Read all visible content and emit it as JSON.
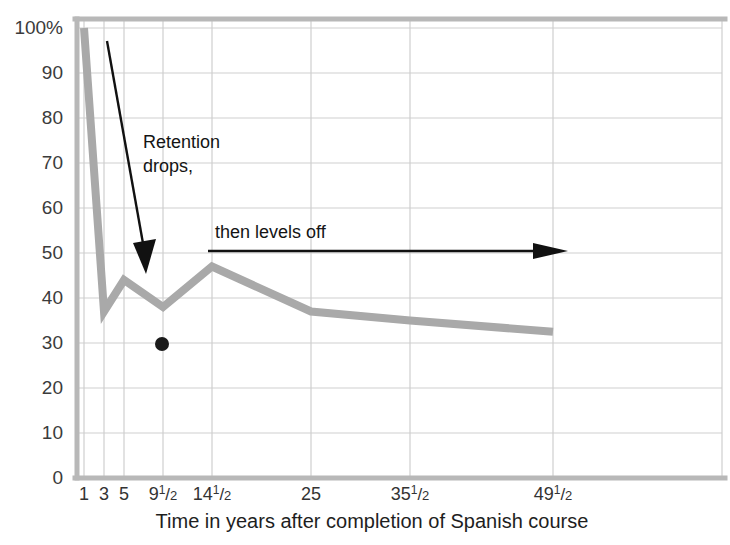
{
  "chart_data": {
    "type": "line",
    "title": "",
    "xlabel": "Time in years after completion of Spanish course",
    "ylabel": "",
    "x_tick_labels": [
      "1",
      "3",
      "5",
      "9½",
      "14½",
      "25",
      "35½",
      "49½"
    ],
    "x_tick_values": [
      1,
      3,
      5,
      9.5,
      14.5,
      25,
      35.5,
      49.5
    ],
    "y_tick_labels": [
      "0",
      "10",
      "20",
      "30",
      "40",
      "50",
      "60",
      "70",
      "80",
      "90",
      "100%"
    ],
    "y_tick_values": [
      0,
      10,
      20,
      30,
      40,
      50,
      60,
      70,
      80,
      90,
      100
    ],
    "ylim": [
      0,
      102
    ],
    "grid": "both",
    "legend": "none",
    "series": [
      {
        "name": "Retention of Spanish",
        "color": "#a9a9a9",
        "x_labels": [
          "1",
          "3",
          "5",
          "9½",
          "14½",
          "25",
          "35½",
          "49½"
        ],
        "values": [
          100,
          37,
          44,
          38,
          47,
          37,
          35,
          32.5
        ]
      }
    ],
    "markers": [
      {
        "name": "single-point",
        "x_label": "8",
        "value": 30,
        "color": "#1a1a1a"
      }
    ],
    "annotations": [
      {
        "name": "retention-drops",
        "text_line1": "Retention",
        "text_line2": "drops,",
        "arrow": "diagonal-down"
      },
      {
        "name": "levels-off",
        "text_line1": "then levels off",
        "text_line2": "",
        "arrow": "horizontal-right"
      }
    ]
  },
  "colors": {
    "line": "#a9a9a9",
    "grid": "#cfcfcf",
    "axis": "#b8b8b8",
    "annotation": "#111111",
    "text": "#333333",
    "background": "#ffffff"
  }
}
